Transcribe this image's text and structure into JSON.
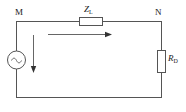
{
  "figure": {
    "type": "circuit-diagram",
    "background_color": "#ffffff",
    "line_color": "#555555",
    "text_color": "#1a1a1a"
  },
  "nodes": {
    "left_terminal": {
      "label": "M",
      "position": {
        "x": 16,
        "y": 22
      }
    },
    "right_terminal": {
      "label": "N",
      "position": {
        "x": 162,
        "y": 22
      }
    }
  },
  "components": {
    "source": {
      "name": "ac-voltage-source",
      "symbol": "~",
      "label": "",
      "center": {
        "x": 16,
        "y": 60
      },
      "radius": 9
    },
    "series_impedance": {
      "name": "series-impedance",
      "label_main": "Z",
      "label_sub": "L",
      "label_full": "Z_L",
      "box": {
        "x": 79,
        "y": 17,
        "width": 24,
        "height": 9
      }
    },
    "load_resistor": {
      "name": "load-resistor",
      "label_main": "R",
      "label_sub": "D",
      "label_full": "R_D",
      "box": {
        "x": 157,
        "y": 50,
        "width": 9,
        "height": 23
      }
    }
  },
  "annotations": {
    "current_arrow_horizontal": {
      "name": "current-direction-arrow-horizontal",
      "direction": "right",
      "label": "",
      "from": {
        "x": 48,
        "y": 34
      },
      "to": {
        "x": 112,
        "y": 34
      }
    },
    "current_arrow_vertical": {
      "name": "current-direction-arrow-vertical",
      "direction": "down",
      "label": "",
      "from": {
        "x": 33,
        "y": 35
      },
      "to": {
        "x": 33,
        "y": 72
      }
    }
  },
  "wires": {
    "top_left_segment": {
      "x1": 16,
      "y1": 22,
      "x2": 79,
      "y2": 22
    },
    "top_right_segment": {
      "x1": 103,
      "y1": 22,
      "x2": 162,
      "y2": 22
    },
    "left_upper": {
      "x1": 16,
      "y1": 22,
      "x2": 16,
      "y2": 51
    },
    "left_lower": {
      "x1": 16,
      "y1": 69,
      "x2": 16,
      "y2": 97
    },
    "bottom": {
      "x1": 16,
      "y1": 97,
      "x2": 162,
      "y2": 97
    },
    "right_upper": {
      "x1": 162,
      "y1": 22,
      "x2": 162,
      "y2": 50
    },
    "right_lower": {
      "x1": 162,
      "y1": 73,
      "x2": 162,
      "y2": 97
    }
  }
}
